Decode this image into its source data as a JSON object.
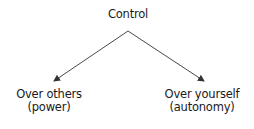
{
  "diagram": {
    "root": {
      "label": "Control"
    },
    "children": [
      {
        "line1": "Over others",
        "line2": "(power)"
      },
      {
        "line1": "Over yourself",
        "line2": "(autonomy)"
      }
    ],
    "edges": [
      {
        "from": "Control",
        "to": "Over others (power)"
      },
      {
        "from": "Control",
        "to": "Over yourself (autonomy)"
      }
    ],
    "colors": {
      "line": "#333333",
      "text": "#1a1a1a",
      "background": "#ffffff"
    }
  }
}
